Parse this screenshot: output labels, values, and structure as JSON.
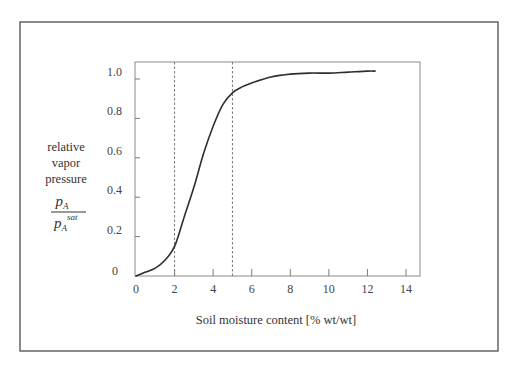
{
  "chart_data": {
    "type": "line",
    "title": "",
    "xlabel": "Soil moisture content [% wt/wt]",
    "ylabel": {
      "lines": [
        "relative",
        "vapor",
        "pressure"
      ],
      "fraction": {
        "numerator": "p",
        "numerator_sub": "A",
        "denominator": "p",
        "denominator_sub": "A",
        "denominator_sup": "sat"
      }
    },
    "xlim": [
      0,
      14
    ],
    "ylim": [
      0,
      1.05
    ],
    "xticks": [
      0,
      2,
      4,
      6,
      8,
      10,
      12,
      14
    ],
    "xtick_labels": [
      "0",
      "2",
      "4",
      "6",
      "8",
      "10",
      "12",
      "14"
    ],
    "yticks": [
      0,
      0.2,
      0.4,
      0.6,
      0.8,
      1.0
    ],
    "ytick_labels": [
      "0",
      "0.2",
      "0.4",
      "0.6",
      "0.8",
      "1.0"
    ],
    "grid": false,
    "legend": "none",
    "series": [
      {
        "name": "relative vapor pressure",
        "x": [
          0,
          0.5,
          1,
          1.5,
          2,
          2.5,
          3,
          3.5,
          4,
          4.5,
          5,
          5.5,
          6,
          7,
          8,
          9,
          10,
          11,
          12,
          12.4
        ],
        "y": [
          0.0,
          0.02,
          0.04,
          0.08,
          0.15,
          0.3,
          0.45,
          0.62,
          0.76,
          0.87,
          0.93,
          0.96,
          0.98,
          1.01,
          1.025,
          1.03,
          1.03,
          1.035,
          1.04,
          1.04
        ]
      }
    ],
    "reference_lines": [
      {
        "axis": "x",
        "value": 2,
        "style": "dashed"
      },
      {
        "axis": "x",
        "value": 5,
        "style": "dashed"
      }
    ]
  },
  "colors": {
    "frame": "#5a5a5a",
    "axis": "#7a7a7a",
    "curve": "#2e2e2e",
    "dashed": "#666666"
  }
}
